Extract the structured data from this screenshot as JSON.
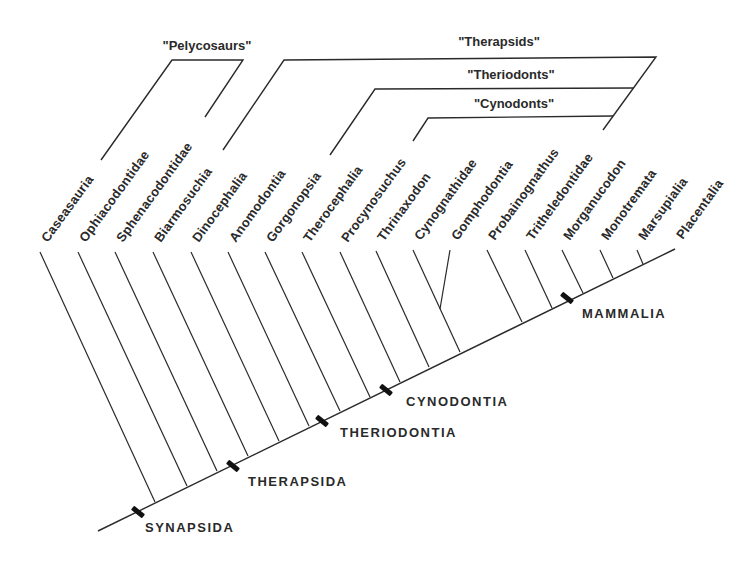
{
  "diagram": {
    "type": "cladogram",
    "line_color": "#2a2a2a",
    "baseline": {
      "x1": 98,
      "y1": 531,
      "x2": 675,
      "y2": 249
    },
    "taxa": [
      {
        "label": "Caseasauria",
        "top": [
          40,
          252
        ],
        "bottom": [
          155,
          502
        ]
      },
      {
        "label": "Ophiacodontidae",
        "top": [
          78,
          252
        ],
        "bottom": [
          187,
          486
        ]
      },
      {
        "label": "Sphenacodontidae",
        "top": [
          115,
          252
        ],
        "bottom": [
          217,
          471
        ]
      },
      {
        "label": "Biarmosuchia",
        "top": [
          153,
          252
        ],
        "bottom": [
          248,
          456
        ]
      },
      {
        "label": "Dinocephalia",
        "top": [
          191,
          252
        ],
        "bottom": [
          279,
          441
        ]
      },
      {
        "label": "Anomodontia",
        "top": [
          228,
          252
        ],
        "bottom": [
          309,
          426
        ]
      },
      {
        "label": "Gorgonopsia",
        "top": [
          265,
          252
        ],
        "bottom": [
          340,
          411
        ]
      },
      {
        "label": "Therocephalia",
        "top": [
          302,
          252
        ],
        "bottom": [
          370,
          397
        ]
      },
      {
        "label": "Procynosuchus",
        "top": [
          340,
          252
        ],
        "bottom": [
          400,
          382
        ]
      },
      {
        "label": "Thrinaxodon",
        "top": [
          376,
          251
        ],
        "bottom": [
          429,
          367
        ]
      },
      {
        "label": "Cynognathidae",
        "top": [
          413,
          250
        ],
        "bottom": [
          460,
          352
        ]
      },
      {
        "label": "Gomphodontia",
        "top": [
          450,
          250
        ],
        "bottom": [
          440,
          309
        ]
      },
      {
        "label": "Probainognathus",
        "top": [
          487,
          250
        ],
        "bottom": [
          522,
          322
        ]
      },
      {
        "label": "Tritheledontidae",
        "top": [
          525,
          250
        ],
        "bottom": [
          552,
          308
        ]
      },
      {
        "label": "Morganucodon",
        "top": [
          562,
          250
        ],
        "bottom": [
          583,
          293
        ]
      },
      {
        "label": "Monotremata",
        "top": [
          600,
          250
        ],
        "bottom": [
          613,
          278
        ]
      },
      {
        "label": "Marsupialia",
        "top": [
          637,
          250
        ],
        "bottom": [
          643,
          264
        ]
      },
      {
        "label": "Placentalia",
        "top": [
          675,
          249
        ],
        "bottom": [
          675,
          249
        ]
      }
    ],
    "groups": [
      {
        "label": "\"Pelycosaurs\"",
        "label_pos": [
          207,
          52
        ],
        "path": [
          [
            101,
            160
          ],
          [
            172,
            60
          ],
          [
            243,
            60
          ],
          [
            205,
            117
          ]
        ]
      },
      {
        "label": "\"Therapsids\"",
        "label_pos": [
          499,
          48
        ],
        "path": [
          [
            223,
            150
          ],
          [
            284,
            60
          ],
          [
            656,
            57
          ],
          [
            603,
            130
          ]
        ]
      },
      {
        "label": "\"Theriodonts\"",
        "label_pos": [
          511,
          81
        ],
        "path": [
          [
            330,
            155
          ],
          [
            375,
            89
          ],
          [
            634,
            88
          ]
        ]
      },
      {
        "label": "\"Cynodonts\"",
        "label_pos": [
          514,
          110
        ],
        "path": [
          [
            413,
            141
          ],
          [
            428,
            118
          ],
          [
            613,
            116
          ]
        ]
      }
    ],
    "nodes": [
      {
        "label": "SYNAPSIDA",
        "marker": [
          138,
          512
        ],
        "label_pos": [
          145,
          520
        ]
      },
      {
        "label": "THERAPSIDA",
        "marker": [
          233,
          466
        ],
        "label_pos": [
          248,
          474
        ]
      },
      {
        "label": "THERIODONTIA",
        "marker": [
          322,
          421
        ],
        "label_pos": [
          340,
          425
        ]
      },
      {
        "label": "CYNODONTIA",
        "marker": [
          386,
          390
        ],
        "label_pos": [
          406,
          394
        ]
      },
      {
        "label": "MAMMALIA",
        "marker": [
          567,
          298
        ],
        "label_pos": [
          582,
          306
        ]
      }
    ]
  }
}
